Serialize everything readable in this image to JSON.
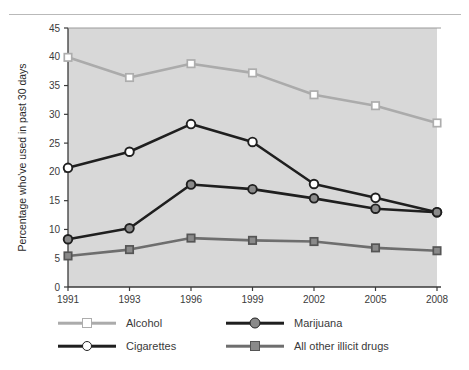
{
  "chart_data": {
    "type": "line",
    "title": "",
    "xlabel": "Year",
    "ylabel": "Percentage who've used in past 30 days",
    "categories": [
      "1991",
      "1993",
      "1996",
      "1999",
      "2002",
      "2005",
      "2008"
    ],
    "x": [
      1991,
      1993,
      1996,
      1999,
      2002,
      2005,
      2008
    ],
    "ylim": [
      0,
      45
    ],
    "yticks": [
      "0",
      "5",
      "10",
      "15",
      "20",
      "25",
      "30",
      "35",
      "40",
      "45"
    ],
    "ytick_values": [
      0,
      5,
      10,
      15,
      20,
      25,
      30,
      35,
      40,
      45
    ],
    "grid": false,
    "legend_position": "below",
    "plot_background": "#d8d8d8",
    "series": [
      {
        "name": "Alcohol",
        "values": [
          39.9,
          36.4,
          38.8,
          37.2,
          33.4,
          31.5,
          28.5
        ],
        "line_color": "#ababab",
        "marker": "square-open",
        "marker_fill": "#ffffff",
        "marker_edge": "#adadad"
      },
      {
        "name": "Cigarettes",
        "values": [
          20.7,
          23.5,
          28.3,
          25.2,
          17.9,
          15.5,
          13.0
        ],
        "line_color": "#1f1f1f",
        "marker": "circle-open",
        "marker_fill": "#ffffff",
        "marker_edge": "#1f1f1f"
      },
      {
        "name": "Marijuana",
        "values": [
          8.3,
          10.2,
          17.8,
          17.0,
          15.4,
          13.6,
          13.0
        ],
        "line_color": "#1f1f1f",
        "marker": "circle-filled",
        "marker_fill": "#8a8a8a",
        "marker_edge": "#1f1f1f"
      },
      {
        "name": "All other illicit drugs",
        "values": [
          5.4,
          6.5,
          8.5,
          8.1,
          7.9,
          6.8,
          6.3
        ],
        "line_color": "#6e6e6e",
        "marker": "square-filled",
        "marker_fill": "#8a8a8a",
        "marker_edge": "#555555"
      }
    ]
  },
  "legend": {
    "entries": [
      {
        "label": "Alcohol"
      },
      {
        "label": "Marijuana"
      },
      {
        "label": "Cigarettes"
      },
      {
        "label": "All other illicit drugs"
      }
    ]
  }
}
